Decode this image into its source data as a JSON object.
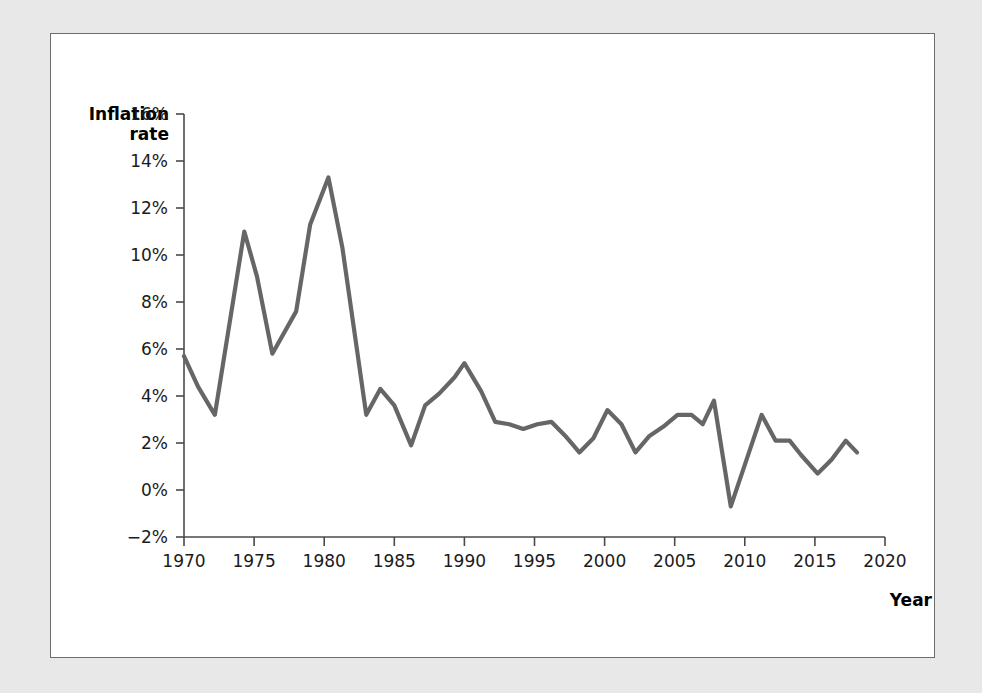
{
  "figure": {
    "background_color": "#e8e8e8",
    "panel_color": "#ffffff",
    "border_color": "#6d6d6d"
  },
  "chart_data": {
    "type": "line",
    "title": "",
    "subtitle": "",
    "xlabel": "Year",
    "ylabel": "Inflation rate",
    "ylabel_line1": "Inflation",
    "ylabel_line2": "rate",
    "xlim": [
      1970,
      2020
    ],
    "ylim": [
      -2,
      16
    ],
    "xticks": [
      1970,
      1975,
      1980,
      1985,
      1990,
      1995,
      2000,
      2005,
      2010,
      2015,
      2020
    ],
    "xtick_labels": [
      "1970",
      "1975",
      "1980",
      "1985",
      "1990",
      "1995",
      "2000",
      "2005",
      "2010",
      "2015",
      "2020"
    ],
    "yticks": [
      -2,
      0,
      2,
      4,
      6,
      8,
      10,
      12,
      14,
      16
    ],
    "ytick_labels": [
      "−2%",
      "0%",
      "2%",
      "4%",
      "6%",
      "8%",
      "10%",
      "12%",
      "14%",
      "16%"
    ],
    "grid": false,
    "legend": false,
    "legend_position": "none",
    "line_color": "#666666",
    "line_width": 4.2,
    "series": [
      {
        "name": "Inflation rate",
        "x": [
          1970,
          1972,
          1974,
          1976,
          1978,
          1980,
          1983,
          1984,
          1986,
          1988,
          1990,
          1992,
          1994,
          1996,
          1998,
          2000,
          2002,
          2004,
          2006,
          2007,
          2009,
          2011,
          2013,
          2015,
          2016,
          2018
        ],
        "values": [
          5.7,
          3.2,
          11.0,
          5.8,
          7.6,
          13.3,
          3.2,
          4.3,
          1.9,
          4.1,
          5.4,
          2.9,
          2.6,
          2.9,
          1.6,
          3.4,
          1.6,
          2.7,
          3.2,
          2.8,
          -0.4,
          3.2,
          2.1,
          0.7,
          1.3,
          2.4
        ],
        "points": [
          {
            "x": 1970.0,
            "y": 5.7
          },
          {
            "x": 1971.0,
            "y": 4.4
          },
          {
            "x": 1972.2,
            "y": 3.2
          },
          {
            "x": 1974.3,
            "y": 11.0
          },
          {
            "x": 1975.2,
            "y": 9.1
          },
          {
            "x": 1976.3,
            "y": 5.8
          },
          {
            "x": 1978.0,
            "y": 7.6
          },
          {
            "x": 1979.0,
            "y": 11.3
          },
          {
            "x": 1980.3,
            "y": 13.3
          },
          {
            "x": 1981.3,
            "y": 10.3
          },
          {
            "x": 1983.0,
            "y": 3.2
          },
          {
            "x": 1984.0,
            "y": 4.3
          },
          {
            "x": 1985.0,
            "y": 3.6
          },
          {
            "x": 1986.2,
            "y": 1.9
          },
          {
            "x": 1987.2,
            "y": 3.6
          },
          {
            "x": 1988.2,
            "y": 4.1
          },
          {
            "x": 1989.3,
            "y": 4.8
          },
          {
            "x": 1990.0,
            "y": 5.4
          },
          {
            "x": 1991.2,
            "y": 4.2
          },
          {
            "x": 1992.2,
            "y": 2.9
          },
          {
            "x": 1993.2,
            "y": 2.8
          },
          {
            "x": 1994.2,
            "y": 2.6
          },
          {
            "x": 1995.2,
            "y": 2.8
          },
          {
            "x": 1996.2,
            "y": 2.9
          },
          {
            "x": 1997.2,
            "y": 2.3
          },
          {
            "x": 1998.2,
            "y": 1.6
          },
          {
            "x": 1999.2,
            "y": 2.2
          },
          {
            "x": 2000.2,
            "y": 3.4
          },
          {
            "x": 2001.2,
            "y": 2.8
          },
          {
            "x": 2002.2,
            "y": 1.6
          },
          {
            "x": 2003.2,
            "y": 2.3
          },
          {
            "x": 2004.2,
            "y": 2.7
          },
          {
            "x": 2005.2,
            "y": 3.2
          },
          {
            "x": 2006.2,
            "y": 3.2
          },
          {
            "x": 2007.0,
            "y": 2.8
          },
          {
            "x": 2007.8,
            "y": 3.8
          },
          {
            "x": 2009.0,
            "y": -0.7
          },
          {
            "x": 2010.3,
            "y": 1.6
          },
          {
            "x": 2011.2,
            "y": 3.2
          },
          {
            "x": 2012.2,
            "y": 2.1
          },
          {
            "x": 2013.2,
            "y": 2.1
          },
          {
            "x": 2014.0,
            "y": 1.5
          },
          {
            "x": 2015.2,
            "y": 0.7
          },
          {
            "x": 2016.2,
            "y": 1.3
          },
          {
            "x": 2017.2,
            "y": 2.1
          },
          {
            "x": 2018.0,
            "y": 1.6
          }
        ]
      }
    ]
  }
}
